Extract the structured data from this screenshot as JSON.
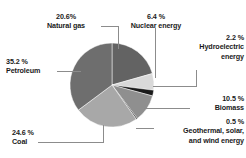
{
  "chart_data": {
    "type": "pie",
    "title": "",
    "categories": [
      "Natural gas",
      "Nuclear energy",
      "Hydroelectric energy",
      "Biomass",
      "Geothermal, solar, and wind energy",
      "Coal",
      "Petroleum"
    ],
    "values": [
      20.6,
      6.4,
      2.2,
      10.5,
      0.5,
      24.6,
      35.2
    ],
    "value_labels": [
      "20.6%",
      "6.4 %",
      "2.2 %",
      "10.5 %",
      "0.5 %",
      "24.6 %",
      "35.2 %"
    ],
    "unit": "%",
    "total": 100.0,
    "legend_position": "callout-labels",
    "grid": false,
    "slice_colors": [
      "#636363",
      "#d9d9d9",
      "#1a1a1a",
      "#8f8f8f",
      "#3f3f3f",
      "#a8a8a8",
      "#6e6e6e"
    ],
    "background": "#ffffff",
    "leader_color": "#8c8c8c"
  },
  "labels": {
    "natural_gas": {
      "pct": "20.6%",
      "name": "Natural gas"
    },
    "nuclear": {
      "pct": "6.4 %",
      "name": "Nuclear energy"
    },
    "hydro": {
      "pct": "2.2 %",
      "name1": "Hydroelectric",
      "name2": "energy"
    },
    "biomass": {
      "pct": "10.5 %",
      "name": "Biomass"
    },
    "geothermal": {
      "pct": "0.5 %",
      "name1": "Geothermal, solar,",
      "name2": "and wind energy"
    },
    "coal": {
      "pct": "24.6 %",
      "name": "Coal"
    },
    "petroleum": {
      "pct": "35.2 %",
      "name": "Petroleum"
    }
  }
}
